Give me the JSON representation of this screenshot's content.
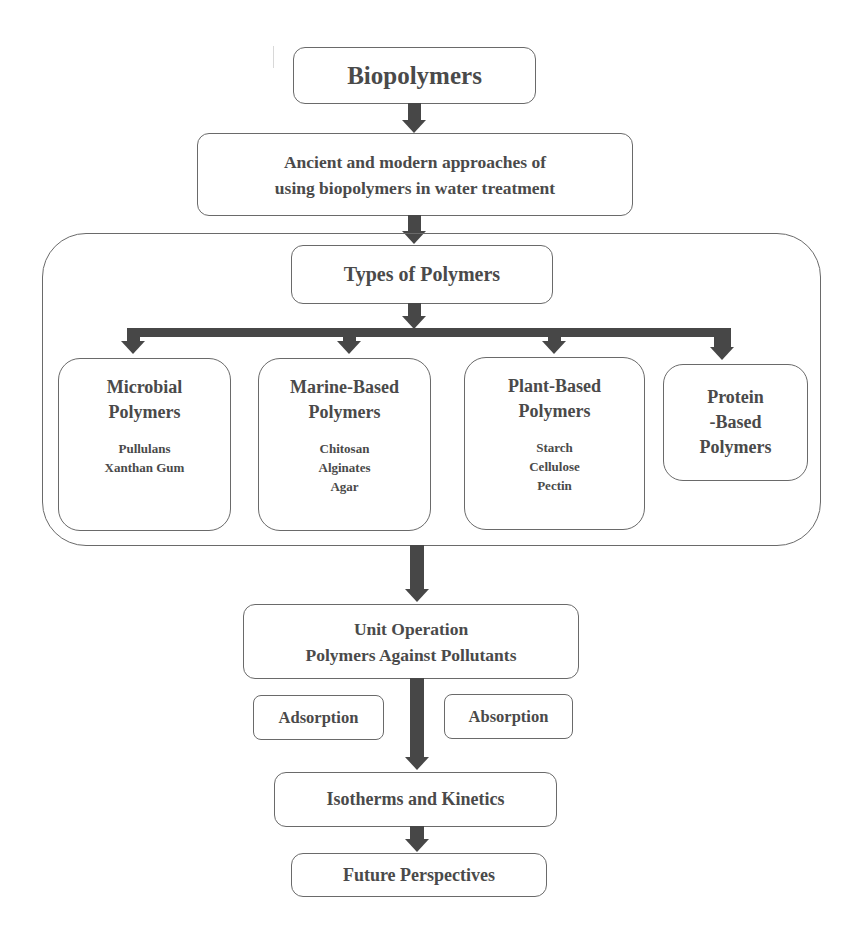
{
  "diagram": {
    "root": "Biopolymers",
    "approaches": [
      "Ancient and modern approaches of",
      "using biopolymers in water treatment"
    ],
    "types": {
      "title": "Types of Polymers",
      "children": [
        {
          "title": [
            "Microbial",
            "Polymers"
          ],
          "examples": [
            "Pullulans",
            "Xanthan Gum"
          ]
        },
        {
          "title": [
            "Marine-Based",
            "Polymers"
          ],
          "examples": [
            "Chitosan",
            "Alginates",
            "Agar"
          ]
        },
        {
          "title": [
            "Plant-Based",
            "Polymers"
          ],
          "examples": [
            "Starch",
            "Cellulose",
            "Pectin"
          ]
        },
        {
          "title": [
            "Protein",
            "-Based",
            "Polymers"
          ],
          "examples": []
        }
      ]
    },
    "unit_operation": [
      "Unit Operation",
      "Polymers Against Pollutants"
    ],
    "processes": [
      "Adsorption",
      "Absorption"
    ],
    "isotherms": "Isotherms and Kinetics",
    "future": "Future Perspectives"
  },
  "colors": {
    "arrow": "#474747",
    "border": "#6a6a6a",
    "text": "#4a4a4a",
    "background": "#ffffff"
  }
}
